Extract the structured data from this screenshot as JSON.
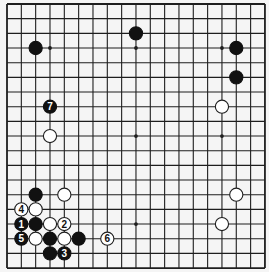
{
  "board": {
    "size": 19,
    "origin_x": 7,
    "origin_y": 4,
    "spacing_x": 14.33,
    "spacing_y": 14.67,
    "stone_radius": 6.6,
    "colors": {
      "background": "#f5f5f5",
      "line": "#1e1e1e",
      "black_stone": "#111111",
      "white_stone": "#ffffff",
      "white_outline": "#1e1e1e"
    },
    "star_points": [
      [
        3,
        3
      ],
      [
        9,
        3
      ],
      [
        15,
        3
      ],
      [
        3,
        9
      ],
      [
        9,
        9
      ],
      [
        15,
        9
      ],
      [
        3,
        15
      ],
      [
        9,
        15
      ],
      [
        15,
        15
      ]
    ]
  },
  "stones": [
    {
      "color": "black",
      "col": 2,
      "row": 3,
      "label": ""
    },
    {
      "color": "black",
      "col": 9,
      "row": 2,
      "label": ""
    },
    {
      "color": "black",
      "col": 16,
      "row": 3,
      "label": ""
    },
    {
      "color": "black",
      "col": 16,
      "row": 5,
      "label": ""
    },
    {
      "color": "white",
      "col": 15,
      "row": 7,
      "label": ""
    },
    {
      "color": "black",
      "col": 3,
      "row": 7,
      "label": "7"
    },
    {
      "color": "white",
      "col": 3,
      "row": 9,
      "label": ""
    },
    {
      "color": "white",
      "col": 16,
      "row": 13,
      "label": ""
    },
    {
      "color": "white",
      "col": 15,
      "row": 15,
      "label": ""
    },
    {
      "color": "black",
      "col": 2,
      "row": 13,
      "label": ""
    },
    {
      "color": "white",
      "col": 4,
      "row": 13,
      "label": ""
    },
    {
      "color": "white",
      "col": 1,
      "row": 14,
      "label": "4"
    },
    {
      "color": "white",
      "col": 2,
      "row": 14,
      "label": ""
    },
    {
      "color": "black",
      "col": 1,
      "row": 15,
      "label": "1"
    },
    {
      "color": "black",
      "col": 2,
      "row": 15,
      "label": ""
    },
    {
      "color": "white",
      "col": 3,
      "row": 15,
      "label": ""
    },
    {
      "color": "white",
      "col": 4,
      "row": 15,
      "label": "2"
    },
    {
      "color": "black",
      "col": 1,
      "row": 16,
      "label": "5"
    },
    {
      "color": "white",
      "col": 2,
      "row": 16,
      "label": ""
    },
    {
      "color": "black",
      "col": 3,
      "row": 16,
      "label": ""
    },
    {
      "color": "white",
      "col": 4,
      "row": 16,
      "label": ""
    },
    {
      "color": "black",
      "col": 5,
      "row": 16,
      "label": ""
    },
    {
      "color": "white",
      "col": 7,
      "row": 16,
      "label": "6"
    },
    {
      "color": "black",
      "col": 3,
      "row": 17,
      "label": ""
    },
    {
      "color": "black",
      "col": 4,
      "row": 17,
      "label": "3"
    }
  ]
}
